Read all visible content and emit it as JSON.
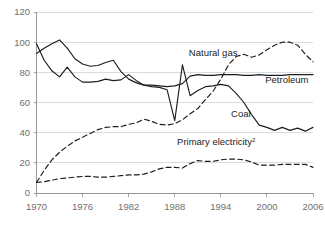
{
  "chart_data": {
    "type": "line",
    "title": "",
    "subtitle": "",
    "xlabel": "",
    "ylabel": "",
    "xlim": [
      1970,
      2006
    ],
    "ylim": [
      0,
      120
    ],
    "grid": true,
    "legend_position": "inline-annotations",
    "y_ticks": [
      0,
      20,
      40,
      60,
      80,
      100,
      120
    ],
    "y_tick_labels": [
      "0",
      "20",
      "40",
      "60",
      "80",
      "100",
      "120"
    ],
    "x_ticks": [
      1970,
      1976,
      1982,
      1988,
      1994,
      2000,
      2006
    ],
    "x_tick_labels": [
      "1970",
      "1976",
      "1982",
      "1988",
      "1994",
      "2000",
      "2006"
    ],
    "annotations": [
      {
        "text": "Natural gas",
        "x": 1993.0,
        "y": 91.0,
        "anchor": "middle",
        "superscript": ""
      },
      {
        "text": "Petroleum",
        "x": 2002.6,
        "y": 73.0,
        "anchor": "middle",
        "superscript": ""
      },
      {
        "text": "Coal",
        "x": 1996.6,
        "y": 50.5,
        "anchor": "middle",
        "superscript": ""
      },
      {
        "text": "Primary electricity",
        "x": 1993.4,
        "y": 31.5,
        "anchor": "middle",
        "superscript": "2"
      }
    ],
    "series": [
      {
        "name": "Petroleum",
        "style": "solid",
        "x": [
          1970,
          1971,
          1972,
          1973,
          1974,
          1975,
          1976,
          1977,
          1978,
          1979,
          1980,
          1981,
          1982,
          1983,
          1984,
          1985,
          1986,
          1987,
          1988,
          1989,
          1990,
          1991,
          1992,
          1993,
          1994,
          1995,
          1996,
          1997,
          1998,
          1999,
          2000,
          2001,
          2002,
          2003,
          2004,
          2005,
          2006
        ],
        "values": [
          92.5,
          96.0,
          99.0,
          101.5,
          96.0,
          89.0,
          85.5,
          84.0,
          84.5,
          86.5,
          88.0,
          80.5,
          75.5,
          73.0,
          71.5,
          71.5,
          71.0,
          70.5,
          71.0,
          72.5,
          77.5,
          78.5,
          78.0,
          78.0,
          78.5,
          78.5,
          78.5,
          78.0,
          78.0,
          78.5,
          78.0,
          78.0,
          78.0,
          78.5,
          78.5,
          78.5,
          78.5
        ]
      },
      {
        "name": "Coal",
        "style": "solid",
        "x": [
          1970,
          1971,
          1972,
          1973,
          1974,
          1975,
          1976,
          1977,
          1978,
          1979,
          1980,
          1981,
          1982,
          1983,
          1984,
          1985,
          1986,
          1987,
          1988,
          1989,
          1990,
          1991,
          1992,
          1993,
          1994,
          1995,
          1996,
          1997,
          1998,
          1999,
          2000,
          2001,
          2002,
          2003,
          2004,
          2005,
          2006
        ],
        "values": [
          99.0,
          88.0,
          81.0,
          77.0,
          83.5,
          77.0,
          73.5,
          73.5,
          74.0,
          75.5,
          74.5,
          75.0,
          78.5,
          74.5,
          71.5,
          70.5,
          70.0,
          68.5,
          48.0,
          85.0,
          64.5,
          68.0,
          70.5,
          71.0,
          72.0,
          71.0,
          66.0,
          60.0,
          52.0,
          45.0,
          43.5,
          41.5,
          43.5,
          41.5,
          43.0,
          41.0,
          43.5
        ]
      },
      {
        "name": "Natural gas",
        "style": "dashed",
        "x": [
          1970,
          1971,
          1972,
          1973,
          1974,
          1975,
          1976,
          1977,
          1978,
          1979,
          1980,
          1981,
          1982,
          1983,
          1984,
          1985,
          1986,
          1987,
          1988,
          1989,
          1990,
          1991,
          1992,
          1993,
          1994,
          1995,
          1996,
          1997,
          1998,
          1999,
          2000,
          2001,
          2002,
          2003,
          2004,
          2005,
          2006
        ],
        "values": [
          7.0,
          15.0,
          22.0,
          27.0,
          31.0,
          34.5,
          37.0,
          39.5,
          42.0,
          43.5,
          44.0,
          44.0,
          45.5,
          46.5,
          49.0,
          47.5,
          45.5,
          45.0,
          46.0,
          48.5,
          52.5,
          56.0,
          62.0,
          67.5,
          75.5,
          85.0,
          90.5,
          92.0,
          90.0,
          91.5,
          95.0,
          98.0,
          100.0,
          100.0,
          98.0,
          92.0,
          87.0
        ]
      },
      {
        "name": "Primary electricity",
        "style": "dashed",
        "x": [
          1970,
          1971,
          1972,
          1973,
          1974,
          1975,
          1976,
          1977,
          1978,
          1979,
          1980,
          1981,
          1982,
          1983,
          1984,
          1985,
          1986,
          1987,
          1988,
          1989,
          1990,
          1991,
          1992,
          1993,
          1994,
          1995,
          1996,
          1997,
          1998,
          1999,
          2000,
          2001,
          2002,
          2003,
          2004,
          2005,
          2006
        ],
        "values": [
          7.0,
          7.5,
          8.5,
          9.5,
          10.0,
          10.5,
          11.0,
          11.0,
          10.5,
          10.5,
          11.0,
          11.5,
          12.0,
          12.0,
          12.5,
          14.0,
          16.0,
          17.0,
          17.0,
          16.5,
          19.5,
          21.5,
          21.0,
          21.0,
          22.0,
          22.5,
          22.5,
          22.0,
          20.5,
          18.5,
          18.5,
          18.5,
          19.0,
          19.0,
          19.0,
          19.0,
          17.0
        ]
      }
    ]
  },
  "colors": {
    "line": "#1d1d1d",
    "gridline": "#c9cdd1",
    "axis": "#8a8f94",
    "tick_label": "#6f6f6f",
    "annotation": "#232323",
    "background": "#ffffff"
  }
}
